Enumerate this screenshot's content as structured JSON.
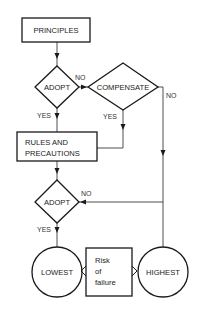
{
  "diagram": {
    "type": "flowchart",
    "nodes": {
      "principles": {
        "label": "PRINCIPLES",
        "shape": "rectangle"
      },
      "adopt1": {
        "label": "ADOPT",
        "shape": "diamond"
      },
      "compensate": {
        "label": "COMPENSATE",
        "shape": "diamond"
      },
      "rules": {
        "label_line1": "RULES AND",
        "label_line2": "PRECAUTIONS",
        "shape": "rectangle"
      },
      "adopt2": {
        "label": "ADOPT",
        "shape": "diamond"
      },
      "lowest": {
        "label": "LOWEST",
        "shape": "circle"
      },
      "risk": {
        "label_line1": "Risk",
        "label_line2": "of",
        "label_line3": "failure",
        "shape": "rectangle"
      },
      "highest": {
        "label": "HIGHEST",
        "shape": "circle"
      }
    },
    "edges": {
      "adopt1_no": "NO",
      "adopt1_yes": "YES",
      "compensate_no": "NO",
      "compensate_yes": "YES",
      "adopt2_no": "NO",
      "adopt2_yes": "YES"
    },
    "colors": {
      "stroke": "#1a1a1a",
      "background": "#ffffff"
    }
  }
}
